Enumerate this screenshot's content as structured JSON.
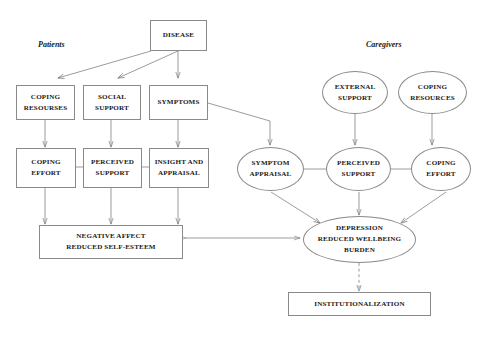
{
  "diagram": {
    "group_labels": {
      "patients": "Patients",
      "caregivers": "Caregivers"
    },
    "colors": {
      "stroke": "#8a8a8a",
      "text": "#1a1a1a",
      "background": "#ffffff"
    },
    "nodes": [
      {
        "id": "disease",
        "shape": "box",
        "lines": [
          "DISEASE"
        ]
      },
      {
        "id": "coping_resourses",
        "shape": "box",
        "lines": [
          "COPING",
          "RESOURSES"
        ]
      },
      {
        "id": "social_support",
        "shape": "box",
        "lines": [
          "SOCIAL",
          "SUPPORT"
        ]
      },
      {
        "id": "symptoms",
        "shape": "box",
        "lines": [
          "SYMPTOMS"
        ]
      },
      {
        "id": "coping_effort_p",
        "shape": "box",
        "lines": [
          "COPING",
          "EFFORT"
        ]
      },
      {
        "id": "perceived_support_p",
        "shape": "box",
        "lines": [
          "PERCEIVED",
          "SUPPORT"
        ]
      },
      {
        "id": "insight_appraisal",
        "shape": "box",
        "lines": [
          "INSIGHT AND",
          "APPRAISAL"
        ]
      },
      {
        "id": "negative_affect",
        "shape": "box",
        "lines": [
          "NEGATIVE AFFECT",
          "REDUCED SELF-ESTEEM"
        ]
      },
      {
        "id": "external_support",
        "shape": "ellipse",
        "lines": [
          "EXTERNAL",
          "SUPPORT"
        ]
      },
      {
        "id": "coping_resources_c",
        "shape": "ellipse",
        "lines": [
          "COPING",
          "RESOURCES"
        ]
      },
      {
        "id": "symptom_appraisal",
        "shape": "ellipse",
        "lines": [
          "SYMPTOM",
          "APPRAISAL"
        ]
      },
      {
        "id": "perceived_support_c",
        "shape": "ellipse",
        "lines": [
          "PERCEIVED",
          "SUPPORT"
        ]
      },
      {
        "id": "coping_effort_c",
        "shape": "ellipse",
        "lines": [
          "COPING",
          "EFFORT"
        ]
      },
      {
        "id": "depression",
        "shape": "ellipse",
        "lines": [
          "DEPRESSION",
          "REDUCED WELLBEING",
          "BURDEN"
        ]
      },
      {
        "id": "institutionalization",
        "shape": "box",
        "lines": [
          "INSTITUTIONALIZATION"
        ]
      }
    ],
    "edges": [
      {
        "from": "disease",
        "to": "coping_resourses",
        "style": "solid",
        "arrow": "single"
      },
      {
        "from": "disease",
        "to": "social_support",
        "style": "solid",
        "arrow": "single"
      },
      {
        "from": "disease",
        "to": "symptoms",
        "style": "solid",
        "arrow": "single"
      },
      {
        "from": "coping_resourses",
        "to": "coping_effort_p",
        "style": "solid",
        "arrow": "single"
      },
      {
        "from": "social_support",
        "to": "perceived_support_p",
        "style": "solid",
        "arrow": "single"
      },
      {
        "from": "symptoms",
        "to": "insight_appraisal",
        "style": "solid",
        "arrow": "single"
      },
      {
        "from": "symptoms",
        "to": "symptom_appraisal",
        "style": "solid",
        "arrow": "single"
      },
      {
        "from": "coping_effort_p",
        "to": "perceived_support_p",
        "style": "solid",
        "arrow": "none"
      },
      {
        "from": "perceived_support_p",
        "to": "insight_appraisal",
        "style": "solid",
        "arrow": "none"
      },
      {
        "from": "coping_effort_p",
        "to": "negative_affect",
        "style": "solid",
        "arrow": "single"
      },
      {
        "from": "perceived_support_p",
        "to": "negative_affect",
        "style": "solid",
        "arrow": "single"
      },
      {
        "from": "insight_appraisal",
        "to": "negative_affect",
        "style": "solid",
        "arrow": "single"
      },
      {
        "from": "external_support",
        "to": "perceived_support_c",
        "style": "solid",
        "arrow": "single"
      },
      {
        "from": "coping_resources_c",
        "to": "coping_effort_c",
        "style": "solid",
        "arrow": "single"
      },
      {
        "from": "symptom_appraisal",
        "to": "perceived_support_c",
        "style": "solid",
        "arrow": "none"
      },
      {
        "from": "perceived_support_c",
        "to": "coping_effort_c",
        "style": "solid",
        "arrow": "none"
      },
      {
        "from": "symptom_appraisal",
        "to": "depression",
        "style": "solid",
        "arrow": "single"
      },
      {
        "from": "perceived_support_c",
        "to": "depression",
        "style": "solid",
        "arrow": "single"
      },
      {
        "from": "coping_effort_c",
        "to": "depression",
        "style": "solid",
        "arrow": "single"
      },
      {
        "from": "negative_affect",
        "to": "depression",
        "style": "solid",
        "arrow": "double"
      },
      {
        "from": "depression",
        "to": "institutionalization",
        "style": "dashed",
        "arrow": "single"
      }
    ]
  }
}
